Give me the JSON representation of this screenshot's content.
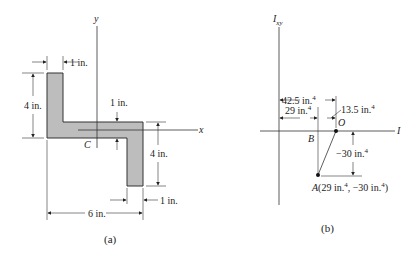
{
  "figure_a": {
    "caption": "(a)",
    "axis_y_label": "y",
    "axis_x_label": "x",
    "centroid_label": "C",
    "dims": {
      "top_flange_width": "1 in.",
      "left_height": "4 in.",
      "web_thickness": "1 in.",
      "right_height": "4 in.",
      "bottom_flange_width": "1 in.",
      "overall_width": "6 in."
    },
    "fill_color": "#bdbdbd"
  },
  "figure_b": {
    "caption": "(b)",
    "vertical_axis_label": "I",
    "vertical_axis_sub": "xy",
    "horizontal_axis_label": "I",
    "point_o": "O",
    "point_b": "B",
    "point_a_label": "A(29 in.",
    "point_a_mid": ", −30 in.",
    "point_a_end": ")",
    "dims": {
      "to_o": "42.5 in.",
      "to_b": "29 in.",
      "b_to_o": "13.5 in.",
      "a_below": "−30 in."
    },
    "exp": "4"
  }
}
